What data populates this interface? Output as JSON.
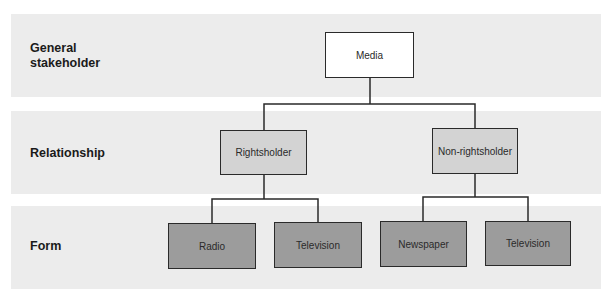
{
  "levels": [
    {
      "label": "General stakeholder"
    },
    {
      "label": "Relationship"
    },
    {
      "label": "Form"
    }
  ],
  "nodes": {
    "media": "Media",
    "rightsholder": "Rightsholder",
    "non_rightsholder": "Non-rightsholder",
    "radio": "Radio",
    "television_1": "Television",
    "newspaper": "Newspaper",
    "television_2": "Television"
  },
  "tree": {
    "name": "Media",
    "children": [
      {
        "name": "Rightsholder",
        "children": [
          {
            "name": "Radio"
          },
          {
            "name": "Television"
          }
        ]
      },
      {
        "name": "Non-rightsholder",
        "children": [
          {
            "name": "Newspaper"
          },
          {
            "name": "Television"
          }
        ]
      }
    ]
  },
  "colors": {
    "band": "#ececec",
    "level1_fill": "#ffffff",
    "level2_fill": "#d3d3d3",
    "level3_fill": "#9c9c9c",
    "stroke": "#2a2a2a"
  }
}
